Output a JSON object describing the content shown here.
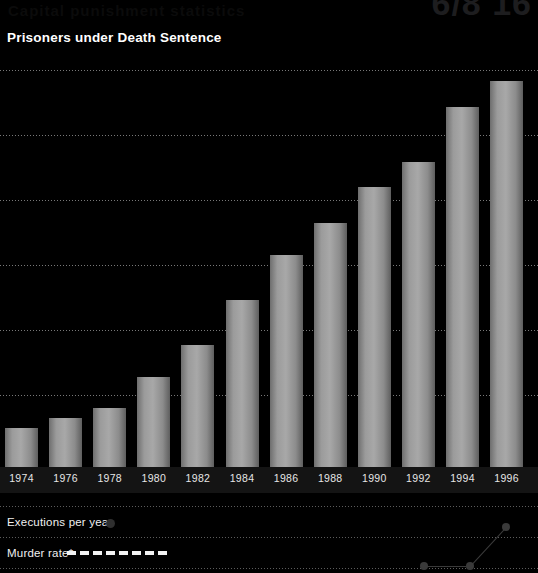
{
  "page": {
    "background_color": "#000000",
    "width": 538,
    "height": 573
  },
  "ghost_header": {
    "clipped_line": "Capital punishment statistics",
    "corner_fragment": "6/8 16"
  },
  "chart_title": "Prisoners under Death Sentence",
  "legend": {
    "executions": {
      "label": "Executions per year",
      "marker": "filled-circle",
      "marker_color": "#2f2f2f"
    },
    "murder_rate": {
      "label": "Murder rate*",
      "marker": "dashed-line",
      "marker_color": "#f2f2f2",
      "dash_count": 8
    }
  },
  "chart_data": {
    "type": "bar",
    "title": "Prisoners under Death Sentence",
    "xlabel": "",
    "ylabel": "",
    "categories": [
      "1974",
      "1976",
      "1978",
      "1980",
      "1982",
      "1984",
      "1986",
      "1988",
      "1990",
      "1992",
      "1994",
      "1996"
    ],
    "values": [
      220,
      275,
      330,
      505,
      680,
      930,
      1185,
      1365,
      1565,
      1705,
      2010,
      2155
    ],
    "ylim": [
      0,
      2300
    ],
    "gridlines": [
      350,
      700,
      1050,
      1400,
      1750,
      2100
    ],
    "grid": true,
    "legend_position": "bottom",
    "bar_color": "#a0a0a0",
    "annotations": [
      "Executions per year",
      "Murder rate*"
    ]
  },
  "bar_geometry": {
    "baseline_y": 412,
    "bar_width": 33,
    "bar_pitch": 44.1,
    "first_bar_left": 5,
    "tops_px": [
      375,
      364,
      353,
      318,
      283,
      233,
      182,
      146,
      106,
      78,
      17,
      -13
    ]
  },
  "gridline_geometry": {
    "y_px": [
      15,
      80,
      145,
      210,
      275,
      340
    ]
  },
  "mini_series": {
    "points": [
      {
        "x": 424,
        "y": 61
      },
      {
        "x": 470,
        "y": 61
      },
      {
        "x": 506,
        "y": 22
      }
    ]
  },
  "legend_geometry": {
    "divider_y_px": [
      506,
      537,
      568
    ],
    "executions_label_y": 516,
    "executions_dot_x": 106,
    "executions_dot_y": 519,
    "murder_label_y": 547,
    "murder_dash_x": 67,
    "murder_dash_y": 551
  }
}
